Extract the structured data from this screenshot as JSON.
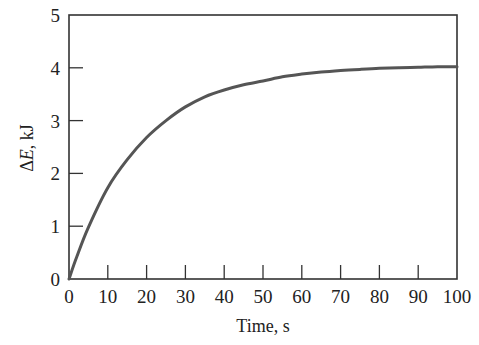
{
  "chart_data": {
    "type": "line",
    "title": "",
    "xlabel": "Time, s",
    "ylabel": "ΔE, kJ",
    "ylabel_parts": {
      "delta": "Δ",
      "var": "E",
      "unit": ", kJ"
    },
    "xlim": [
      0,
      100
    ],
    "ylim": [
      0,
      5
    ],
    "xticks": [
      0,
      10,
      20,
      30,
      40,
      50,
      60,
      70,
      80,
      90,
      100
    ],
    "yticks": [
      0,
      1,
      2,
      3,
      4,
      5
    ],
    "grid": false,
    "legend": null,
    "series": [
      {
        "name": "ΔE",
        "color": "#555555",
        "x": [
          0,
          2,
          5,
          10,
          15,
          20,
          25,
          30,
          35,
          40,
          45,
          50,
          55,
          60,
          65,
          70,
          75,
          80,
          85,
          90,
          95,
          100
        ],
        "values": [
          0,
          0.42,
          0.98,
          1.73,
          2.26,
          2.68,
          3.0,
          3.26,
          3.45,
          3.58,
          3.68,
          3.75,
          3.83,
          3.88,
          3.92,
          3.95,
          3.97,
          3.99,
          4.0,
          4.01,
          4.02,
          4.02
        ]
      }
    ]
  }
}
